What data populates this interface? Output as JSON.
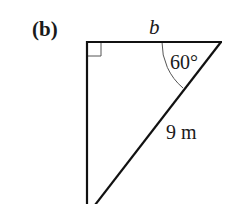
{
  "figure": {
    "part_label": "(b)",
    "shape": "right triangle",
    "right_angle_vertex": "top-left",
    "labels": {
      "top_side": "b",
      "angle": "60°",
      "hypotenuse": "9 m"
    },
    "colors": {
      "stroke": "#111111",
      "marker_stroke": "#555555",
      "background": "#ffffff"
    }
  }
}
